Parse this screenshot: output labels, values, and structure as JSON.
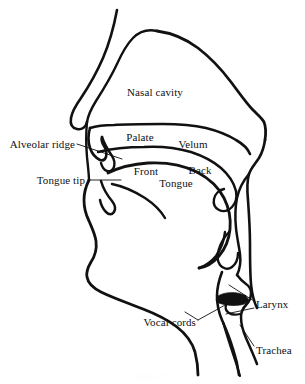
{
  "figure": {
    "background_color": "#ffffff",
    "line_color": "#111111",
    "caption_partial": "Figure 2.1"
  },
  "labels": {
    "nasal_cavity": "Nasal cavity",
    "palate": "Palate",
    "velum": "Velum",
    "alveolar_ridge": "Alveolar ridge",
    "tongue_tip": "Tongue tip",
    "front": "Front",
    "back": "Back",
    "tongue": "Tongue",
    "vocal_cords": "Vocal cords",
    "larynx": "Larynx",
    "trachea": "Trachea"
  },
  "annotations": [
    {
      "name": "nasal-cavity",
      "text": "Nasal cavity",
      "x": 155,
      "y": 92,
      "align": "center",
      "leader": false
    },
    {
      "name": "palate",
      "text": "Palate",
      "x": 140,
      "y": 137,
      "align": "center",
      "leader": false
    },
    {
      "name": "velum",
      "text": "Velum",
      "x": 193,
      "y": 144,
      "align": "center",
      "leader": false
    },
    {
      "name": "alveolar-ridge",
      "text": "Alveolar ridge",
      "x": 75,
      "y": 144,
      "align": "right",
      "leader": true
    },
    {
      "name": "tongue-tip",
      "text": "Tongue tip",
      "x": 85,
      "y": 180,
      "align": "right",
      "leader": true
    },
    {
      "name": "front",
      "text": "Front",
      "x": 146,
      "y": 171,
      "align": "center",
      "leader": false
    },
    {
      "name": "back",
      "text": "Back",
      "x": 200,
      "y": 170,
      "align": "center",
      "leader": false
    },
    {
      "name": "tongue",
      "text": "Tongue",
      "x": 176,
      "y": 183,
      "align": "center",
      "leader": false
    },
    {
      "name": "vocal-cords",
      "text": "Vocal cords",
      "x": 196,
      "y": 322,
      "align": "right",
      "leader": true
    },
    {
      "name": "larynx",
      "text": "Larynx",
      "x": 256,
      "y": 304,
      "align": "left",
      "leader": true
    },
    {
      "name": "trachea",
      "text": "Trachea",
      "x": 256,
      "y": 350,
      "align": "left",
      "leader": true
    }
  ]
}
